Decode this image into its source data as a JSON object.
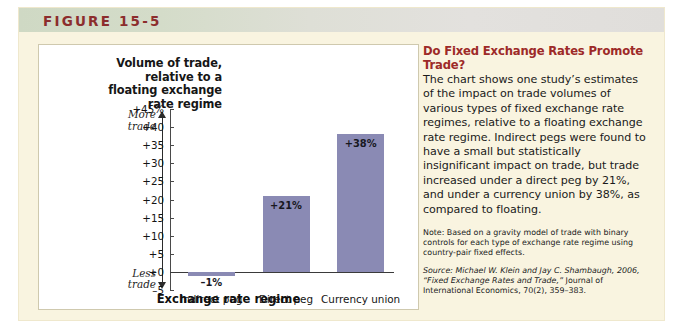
{
  "figure": {
    "label": "FIGURE 15-5",
    "header_bg_start": "#cfd9c4",
    "header_bg_end": "#e0dedb",
    "panel_bg": "#f9f4e0",
    "label_color": "#8c2d2d"
  },
  "chart_data": {
    "type": "bar",
    "title": "",
    "categories": [
      "Indirect peg",
      "Direct peg",
      "Currency union"
    ],
    "values": [
      -1,
      21,
      38
    ],
    "data_labels": [
      "–1%",
      "+21%",
      "+38%"
    ],
    "ylabel": "Volume of trade, relative to a floating exchange rate regime",
    "ylabel_lines": [
      "Volume of trade,",
      "relative to a",
      "floating exchange",
      "rate regime"
    ],
    "xlabel": "Exchange rate regime",
    "ylim": [
      -5,
      45
    ],
    "ytick_values": [
      45,
      40,
      35,
      30,
      25,
      20,
      15,
      10,
      5,
      0,
      -5
    ],
    "ytick_labels": [
      "+45%",
      "+40",
      "+35",
      "+30",
      "+25",
      "+20",
      "+15",
      "+10",
      "+5",
      "+0",
      "–5"
    ],
    "grid": false,
    "legend": "none",
    "bar_color": "#8a8ab4",
    "axis_annotations": {
      "top_line1": "More",
      "top_line2": "trade",
      "bottom_line1": "Less",
      "bottom_line2": "trade"
    }
  },
  "sidebar": {
    "headline": "Do Fixed Exchange Rates Promote Trade?",
    "body": "The chart shows one study’s estimates of the impact on trade volumes of various types of fixed exchange rate regimes, relative to a floating exchange rate regime. Indirect pegs were found to have a small but statistically insignificant impact on trade, but trade increased under a direct peg by 21%, and under a currency union by 38%, as compared to floating.",
    "note": "Note: Based on a gravity model of trade with binary controls for each type of exchange rate regime using country-pair fixed effects.",
    "source_prefix": "Source:",
    "source_italic": "Michael W. Klein and Jay C. Shambaugh, 2006, “Fixed Exchange Rates and Trade,”",
    "source_rest": "Journal of International Economics, 70(2), 359–383.",
    "headline_color": "#9d2a28"
  }
}
